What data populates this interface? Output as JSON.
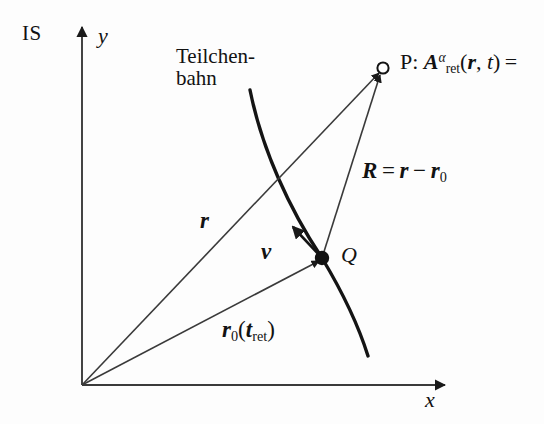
{
  "figure": {
    "background_color": "#fdfdfd",
    "ink_color": "#1a1a1a"
  },
  "labels": {
    "frame": "IS",
    "y_axis": "y",
    "x_axis": "x",
    "trajectory_line1": "Teilchen-",
    "trajectory_line2": "bahn",
    "vector_r": "r",
    "vector_v": "v",
    "point_q": "Q",
    "point_p_prefix": "P:",
    "potential_symbol": "A",
    "potential_superscript": "α",
    "potential_subscript": "ret",
    "potential_args_open": "(",
    "potential_arg_r": "r",
    "potential_arg_comma": ", ",
    "potential_arg_t": "t",
    "potential_args_close": ")",
    "potential_equals": "=",
    "relation_R": "R",
    "relation_equals": "=",
    "relation_r": "r",
    "relation_minus": "−",
    "relation_r0": "r",
    "relation_r0_sub": "0",
    "position_r0": "r",
    "position_r0_sub": "0",
    "position_paren_open": "(",
    "position_t": "t",
    "position_t_sub": "ret",
    "position_paren_close": ")"
  },
  "geometry": {
    "origin": {
      "x": 82,
      "y": 385
    },
    "point_q": {
      "x": 322,
      "y": 258
    },
    "point_p": {
      "x": 383,
      "y": 68
    },
    "y_axis_top": {
      "x": 82,
      "y": 25
    },
    "x_axis_right": {
      "x": 447,
      "y": 385
    },
    "velocity_tip": {
      "x": 292,
      "y": 225
    },
    "trajectory_start": {
      "x": 250,
      "y": 90
    },
    "trajectory_end": {
      "x": 368,
      "y": 356
    }
  }
}
